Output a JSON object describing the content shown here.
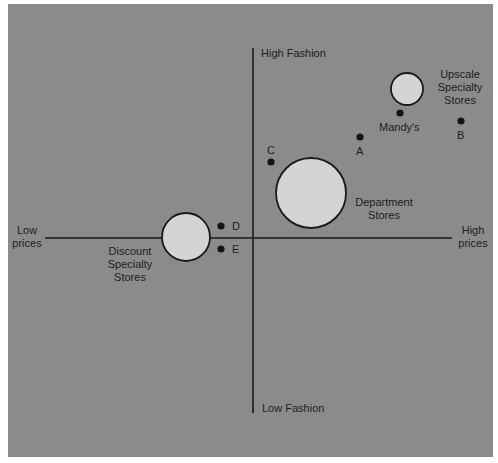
{
  "diagram": {
    "type": "perceptual-map",
    "colors": {
      "background": "#8b8b8b",
      "page": "#ffffff",
      "axis": "#1a1a1a",
      "circle_fill": "#d4d4d4",
      "point": "#151515",
      "text": "#1e1e1e"
    },
    "axes": {
      "y_top": "High Fashion",
      "y_bottom": "Low Fashion",
      "x_left": [
        "Low",
        "prices"
      ],
      "x_right": [
        "High",
        "prices"
      ]
    },
    "segments": [
      {
        "name": "Upscale Specialty Stores",
        "lines": [
          "Upscale",
          "Specialty",
          "Stores"
        ],
        "cx": 407,
        "cy": 89,
        "r": 16
      },
      {
        "name": "Department Stores",
        "lines": [
          "Department",
          "Stores"
        ],
        "cx": 311,
        "cy": 193,
        "r": 35
      },
      {
        "name": "Discount Specialty Stores",
        "lines": [
          "Discount",
          "Specialty",
          "Stores"
        ],
        "cx": 186,
        "cy": 237,
        "r": 24
      }
    ],
    "points": [
      {
        "label": "Mandy's",
        "x": 400,
        "y": 113
      },
      {
        "label": "B",
        "x": 461,
        "y": 121
      },
      {
        "label": "A",
        "x": 360,
        "y": 137
      },
      {
        "label": "C",
        "x": 271,
        "y": 162
      },
      {
        "label": "D",
        "x": 221,
        "y": 226
      },
      {
        "label": "E",
        "x": 221,
        "y": 249
      }
    ]
  }
}
